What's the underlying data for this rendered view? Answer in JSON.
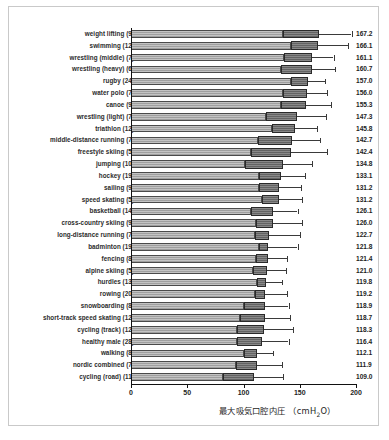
{
  "chart_data": {
    "type": "bar",
    "title": "",
    "subtitle": "",
    "xlabel": "最大吸気口腔内圧 （cmH2O）",
    "xlabel_main": "最大吸気口腔内圧 （cmH",
    "xlabel_sub": "2",
    "xlabel_tail": "O）",
    "ylabel": "",
    "xlim": [
      0,
      200
    ],
    "xticks": [
      0,
      50,
      100,
      150,
      200
    ],
    "xticklabels": [
      "0",
      "50",
      "100",
      "150",
      "200"
    ],
    "grid": false,
    "legend": "none",
    "orientation": "horizontal",
    "categories": [
      "weight lifting (9)",
      "swimming (12)",
      "wrestling (middle) (7)",
      "wrestling (heavy) (6)",
      "rugby (24)",
      "water polo (7)",
      "canoe (9)",
      "wrestling (light) (7)",
      "triathlon (12)",
      "middle-distance running (7)",
      "freestyle skiing (5)",
      "jumping (10)",
      "hockey (19)",
      "sailing (9)",
      "speed skating (5)",
      "basketball (14)",
      "cross-country skiing (9)",
      "long-distance running (7)",
      "badminton (19)",
      "fencing (8)",
      "alpine skiing (5)",
      "hurdles (13)",
      "rowing (20)",
      "snowboarding (8)",
      "short-track speed skating (12)",
      "cycling (track) (12)",
      "healthy male (28)",
      "walking (8)",
      "nordic combined (7)",
      "cycling (road) (11)"
    ],
    "values": [
      167.2,
      166.1,
      161.1,
      160.7,
      157.0,
      156.0,
      155.3,
      147.3,
      145.8,
      142.7,
      142.4,
      134.8,
      133.1,
      131.2,
      131.2,
      126.1,
      126.0,
      122.7,
      121.8,
      121.4,
      121.0,
      119.8,
      119.2,
      118.9,
      118.7,
      118.3,
      116.4,
      112.1,
      111.9,
      109.0
    ],
    "value_labels": [
      "167.2",
      "166.1",
      "161.1",
      "160.7",
      "157.0",
      "156.0",
      "155.3",
      "147.3",
      "145.8",
      "142.7",
      "142.4",
      "134.8",
      "133.1",
      "131.2",
      "131.2",
      "126.1",
      "126.0",
      "122.7",
      "121.8",
      "121.4",
      "121.0",
      "119.8",
      "119.2",
      "118.9",
      "118.7",
      "118.3",
      "116.4",
      "112.1",
      "111.9",
      "109.0"
    ],
    "box_low": [
      135.0,
      142.0,
      136.0,
      133.0,
      142.0,
      135.0,
      133.0,
      120.0,
      125.0,
      113.0,
      107.0,
      101.0,
      114.0,
      114.0,
      116.0,
      107.0,
      111.0,
      110.0,
      114.0,
      111.0,
      108.0,
      112.0,
      110.0,
      100.0,
      97.0,
      94.0,
      94.0,
      100.0,
      93.0,
      82.0
    ],
    "whisker_high": [
      196.0,
      193.0,
      180.0,
      181.0,
      172.0,
      174.0,
      178.0,
      173.0,
      165.0,
      168.0,
      174.0,
      161.0,
      155.0,
      151.0,
      152.0,
      148.0,
      152.0,
      150.0,
      148.0,
      139.0,
      138.0,
      134.0,
      139.0,
      140.0,
      141.0,
      144.0,
      140.0,
      126.0,
      134.0,
      135.0
    ],
    "series": [
      {
        "name": "maximal inspiratory mouth pressure",
        "values": [
          167.2,
          166.1,
          161.1,
          160.7,
          157.0,
          156.0,
          155.3,
          147.3,
          145.8,
          142.7,
          142.4,
          134.8,
          133.1,
          131.2,
          131.2,
          126.1,
          126.0,
          122.7,
          121.8,
          121.4,
          121.0,
          119.8,
          119.2,
          118.9,
          118.7,
          118.3,
          116.4,
          112.1,
          111.9,
          109.0
        ]
      }
    ],
    "colors": {
      "bar_light": "#a9a9a9",
      "bar_box": "#6e6e6e",
      "bar_outline": "#2a2a2a",
      "whisker": "#3a3a3a",
      "axis": "#111111",
      "text": "#1d1d1d",
      "frame": "#c9c9c9",
      "background": "#ffffff"
    }
  }
}
